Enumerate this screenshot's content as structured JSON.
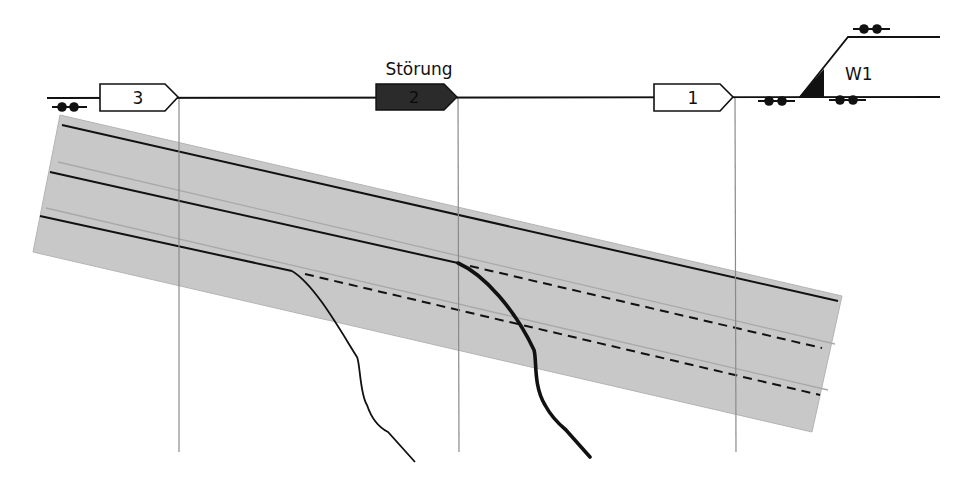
{
  "diagram": {
    "title": "",
    "colors": {
      "track": "#111111",
      "band_fill": "#c8c8c8",
      "band_edge": "#b4b4b4",
      "band_inner_line": "#a9a9a9",
      "guide_line": "#8a8a8a",
      "signal_normal_fill": "#ffffff",
      "signal_fault_fill": "#2b2b2b",
      "text": "#111111"
    },
    "signals": [
      {
        "id": "signal-3",
        "label": "3",
        "state": "normal"
      },
      {
        "id": "signal-2",
        "label": "2",
        "state": "fault",
        "annotation": "Störung"
      },
      {
        "id": "signal-1",
        "label": "1",
        "state": "normal"
      }
    ],
    "switch": {
      "label": "W1"
    },
    "axle_counters": [
      {
        "id": "axle-counter-left"
      },
      {
        "id": "axle-counter-before-switch"
      },
      {
        "id": "axle-counter-after-switch"
      },
      {
        "id": "axle-counter-branch"
      }
    ],
    "band": {
      "tracks": [
        {
          "id": "track-line-1",
          "style": "solid"
        },
        {
          "id": "track-line-2",
          "style": "solid-then-dashed"
        },
        {
          "id": "track-line-3",
          "style": "solid-then-dashed"
        }
      ],
      "curves": [
        {
          "id": "curve-thin",
          "weight": "thin"
        },
        {
          "id": "curve-thick",
          "weight": "thick"
        }
      ]
    }
  }
}
